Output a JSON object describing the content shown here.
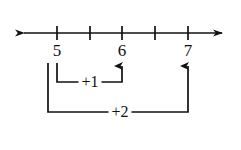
{
  "figure": {
    "background_color": "#ffffff",
    "ink_color": "#111111"
  },
  "number_line": {
    "axis_y": 33,
    "x_start": 18,
    "x_end": 228,
    "left_arrow": "left-arrowhead",
    "right_arrow": "right-arrowhead",
    "tick_positions": [
      57,
      90,
      122,
      155,
      188
    ],
    "tick_half_height": 7,
    "labels": [
      {
        "text": "5",
        "x": 57,
        "y": 42
      },
      {
        "text": "6",
        "x": 122,
        "y": 42
      },
      {
        "text": "7",
        "x": 188,
        "y": 42
      }
    ],
    "unlabeled_ticks": [
      90,
      155
    ]
  },
  "jumps": [
    {
      "name": "plus-one-jump",
      "label": "+1",
      "from_value": "5",
      "to_value": "6",
      "from_x": 57,
      "to_x": 122,
      "drop_y": 82,
      "arrow_top_y": 62,
      "label_x": 90,
      "label_y": 82
    },
    {
      "name": "plus-two-jump",
      "label": "+2",
      "from_value": "5",
      "to_value": "7",
      "from_x": 48,
      "to_x": 188,
      "drop_y": 112,
      "arrow_top_y": 62,
      "label_x": 120,
      "label_y": 112
    }
  ]
}
